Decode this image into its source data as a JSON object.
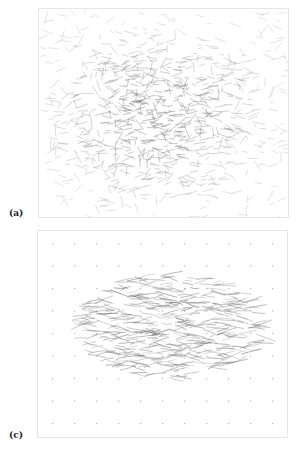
{
  "figure": {
    "panels": [
      {
        "id": "a",
        "label": "(a)",
        "description": "Dense random fiber network; darker central cluster of short line segments fading toward edges",
        "fiber_color": "#777777"
      },
      {
        "id": "c",
        "label": "(c)",
        "description": "Regular grid of small dots with an elliptical cluster of wavy, mostly horizontal fiber strokes in the center",
        "fiber_color": "#666666",
        "grid_dot_color": "#bbbbbb"
      }
    ]
  }
}
